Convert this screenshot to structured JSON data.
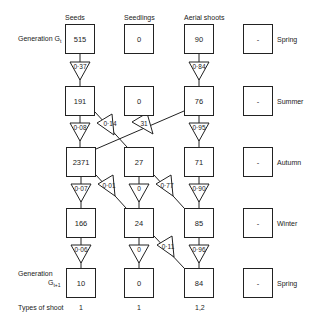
{
  "columns": [
    "Seeds",
    "Seedlings",
    "Aerial shoots"
  ],
  "rows": [
    {
      "label": "Generation G",
      "label_sub": "t",
      "season": "Spring",
      "values": [
        "515",
        "0",
        "90",
        "-"
      ]
    },
    {
      "label": "",
      "season": "Summer",
      "values": [
        "191",
        "0",
        "76",
        "-"
      ]
    },
    {
      "label": "",
      "season": "Autumn",
      "values": [
        "2371",
        "27",
        "71",
        "-"
      ]
    },
    {
      "label": "",
      "season": "Winter",
      "values": [
        "166",
        "24",
        "85",
        "-"
      ]
    },
    {
      "label": "Generation",
      "label_sub": "t+1",
      "label_G": "G",
      "season": "Spring",
      "values": [
        "10",
        "0",
        "84",
        "-"
      ]
    }
  ],
  "transitions": [
    {
      "from": "seeds-spring",
      "to": "seeds-summer",
      "value": "0·37"
    },
    {
      "from": "aerial-spring",
      "to": "aerial-summer",
      "value": "0·84"
    },
    {
      "from": "seeds-summer",
      "to": "seeds-autumn",
      "value": "0·08"
    },
    {
      "from": "seeds-summer",
      "to": "seedlings-autumn",
      "value": "0·14"
    },
    {
      "from": "aerial-summer",
      "to": "seeds-autumn",
      "value": "31"
    },
    {
      "from": "aerial-summer",
      "to": "aerial-autumn",
      "value": "0·95"
    },
    {
      "from": "seeds-autumn",
      "to": "seeds-winter",
      "value": "0·07"
    },
    {
      "from": "seeds-autumn",
      "to": "seedlings-winter",
      "value": "0·01"
    },
    {
      "from": "seedlings-autumn",
      "to": "seedlings-winter",
      "value": "0"
    },
    {
      "from": "seedlings-autumn",
      "to": "aerial-winter",
      "value": "0·77"
    },
    {
      "from": "aerial-autumn",
      "to": "aerial-winter",
      "value": "0·90"
    },
    {
      "from": "seeds-winter",
      "to": "seeds-spring2",
      "value": "0·06"
    },
    {
      "from": "seedlings-winter",
      "to": "seedlings-spring2",
      "value": "0"
    },
    {
      "from": "seedlings-winter",
      "to": "aerial-spring2",
      "value": "0·11"
    },
    {
      "from": "aerial-winter",
      "to": "aerial-spring2",
      "value": "0·96"
    }
  ],
  "footer": {
    "label": "Types of shoot",
    "values": [
      "1",
      "1",
      "1,2"
    ]
  }
}
